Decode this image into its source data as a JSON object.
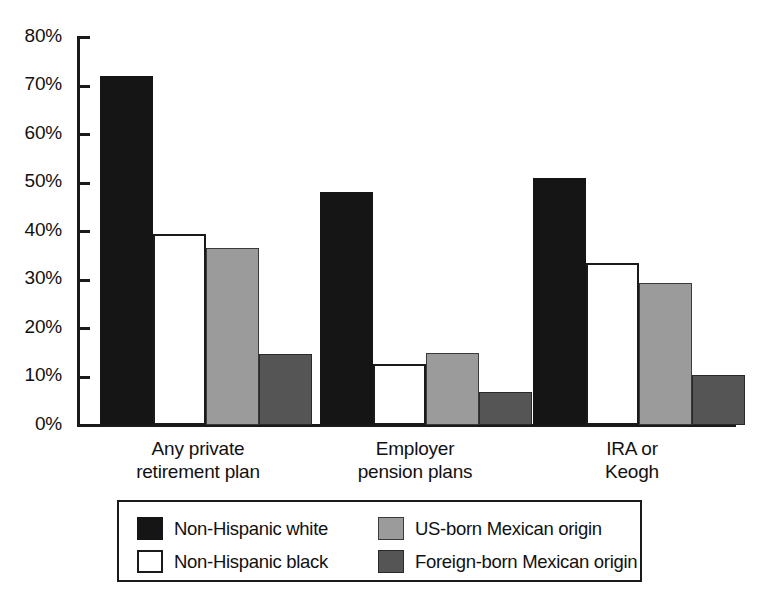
{
  "chart_data": {
    "type": "bar",
    "title": "",
    "subtitle": "",
    "xlabel": "",
    "ylabel": "",
    "ylim": [
      0,
      80
    ],
    "ytick_labels": [
      "80%",
      "70%",
      "60%",
      "50%",
      "40%",
      "30%",
      "20%",
      "10%",
      "0%"
    ],
    "ytick_values": [
      80,
      70,
      60,
      50,
      40,
      30,
      20,
      10,
      0
    ],
    "grid": false,
    "legend_position": "bottom",
    "categories": [
      "Any private retirement plan",
      "Employer pension plans",
      "IRA or Keogh"
    ],
    "category_label_lines": [
      [
        "Any private",
        "retirement plan"
      ],
      [
        "Employer",
        "pension plans"
      ],
      [
        "IRA or",
        "Keogh"
      ]
    ],
    "series": [
      {
        "name": "Non-Hispanic white",
        "color": "#151515",
        "swatch_style": "black",
        "values": [
          72,
          48,
          51
        ]
      },
      {
        "name": "Non-Hispanic black",
        "color": "#ffffff",
        "swatch_style": "white",
        "values": [
          39.3,
          12.6,
          33.5
        ]
      },
      {
        "name": "US-born Mexican origin",
        "color": "#9b9b9b",
        "swatch_style": "lgray",
        "values": [
          36.6,
          14.8,
          29.2
        ]
      },
      {
        "name": "Foreign-born Mexican origin",
        "color": "#555555",
        "swatch_style": "dgray",
        "values": [
          14.7,
          6.8,
          10.4
        ]
      }
    ]
  },
  "legend": {
    "entries": [
      "Non-Hispanic white",
      "US-born Mexican origin",
      "Non-Hispanic black",
      "Foreign-born Mexican origin"
    ]
  },
  "axis": {
    "y_labels": [
      "80%",
      "70%",
      "60%",
      "50%",
      "40%",
      "30%",
      "20%",
      "10%",
      "0%"
    ]
  }
}
